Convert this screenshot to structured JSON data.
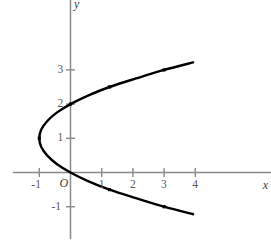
{
  "chart_data": {
    "type": "line",
    "title": "",
    "subtitle": "",
    "xlabel": "x",
    "ylabel": "y",
    "origin_label": "O",
    "grid": false,
    "legend": null,
    "xlim": [
      -1.85,
      6.45
    ],
    "ylim": [
      -1.95,
      5.05
    ],
    "xticks": [
      -1,
      1,
      2,
      3,
      4
    ],
    "xtick_labels": [
      "-1",
      "1",
      "2",
      "3",
      "4"
    ],
    "yticks": [
      -1,
      1,
      2,
      3
    ],
    "ytick_labels": [
      "-1",
      "1",
      "2",
      "3"
    ],
    "equation": "x = y^2 - 2y",
    "curve_color": "#000000",
    "axis_color": "#8a8a8c",
    "marker_color": "#000000",
    "series": [
      {
        "name": "x = y^2 - 2y",
        "parameter": "y",
        "y_start": -1.22,
        "y_end": 3.22,
        "points": [
          {
            "x": 3.93,
            "y": -1.22
          },
          {
            "x": 3.0,
            "y": -1.0
          },
          {
            "x": 2.1,
            "y": -0.75
          },
          {
            "x": 1.25,
            "y": -0.5
          },
          {
            "x": 0.56,
            "y": -0.25
          },
          {
            "x": 0.0,
            "y": 0.0
          },
          {
            "x": -0.44,
            "y": 0.25
          },
          {
            "x": -0.75,
            "y": 0.5
          },
          {
            "x": -0.94,
            "y": 0.75
          },
          {
            "x": -1.0,
            "y": 1.0
          },
          {
            "x": -0.94,
            "y": 1.25
          },
          {
            "x": -0.75,
            "y": 1.5
          },
          {
            "x": -0.44,
            "y": 1.75
          },
          {
            "x": 0.0,
            "y": 2.0
          },
          {
            "x": 0.56,
            "y": 2.25
          },
          {
            "x": 1.25,
            "y": 2.5
          },
          {
            "x": 2.1,
            "y": 2.75
          },
          {
            "x": 3.0,
            "y": 3.0
          },
          {
            "x": 3.93,
            "y": 3.22
          }
        ]
      }
    ],
    "marked_points": [
      {
        "x": -1.0,
        "y": 1.0
      },
      {
        "x": 0.0,
        "y": 2.0
      },
      {
        "x": 1.25,
        "y": 2.5
      },
      {
        "x": 3.0,
        "y": 3.0
      },
      {
        "x": 1.25,
        "y": -0.5
      },
      {
        "x": 3.0,
        "y": -1.0
      }
    ]
  },
  "labels": {
    "x_axis": "x",
    "y_axis": "y",
    "origin": "O",
    "x_neg1": "-1",
    "x_1": "1",
    "x_2": "2",
    "x_3": "3",
    "x_4": "4",
    "y_neg1": "-1",
    "y_1": "1",
    "y_2": "2",
    "y_3": "3"
  }
}
